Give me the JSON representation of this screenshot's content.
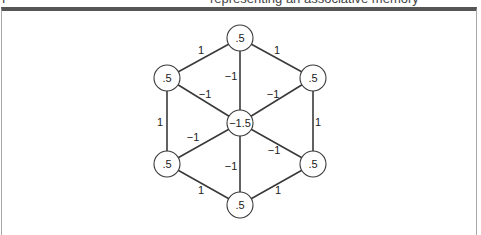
{
  "caption": {
    "prefix": "F",
    "text": "representing an associative memory"
  },
  "diagram": {
    "type": "hopfield-network",
    "nodes": [
      {
        "id": "top",
        "value": ".5"
      },
      {
        "id": "upper-left",
        "value": ".5"
      },
      {
        "id": "upper-right",
        "value": ".5"
      },
      {
        "id": "center",
        "value": "−1.5"
      },
      {
        "id": "lower-left",
        "value": ".5"
      },
      {
        "id": "lower-right",
        "value": ".5"
      },
      {
        "id": "bottom",
        "value": ".5"
      }
    ],
    "edges": [
      {
        "from": "top",
        "to": "upper-left",
        "weight": "1"
      },
      {
        "from": "top",
        "to": "upper-right",
        "weight": "1"
      },
      {
        "from": "top",
        "to": "center",
        "weight": "−1"
      },
      {
        "from": "upper-left",
        "to": "center",
        "weight": "−1"
      },
      {
        "from": "upper-right",
        "to": "center",
        "weight": "−1"
      },
      {
        "from": "upper-left",
        "to": "lower-left",
        "weight": "1"
      },
      {
        "from": "upper-right",
        "to": "lower-right",
        "weight": "1"
      },
      {
        "from": "lower-left",
        "to": "center",
        "weight": "−1"
      },
      {
        "from": "lower-right",
        "to": "center",
        "weight": "−1"
      },
      {
        "from": "bottom",
        "to": "center",
        "weight": "−1"
      },
      {
        "from": "lower-left",
        "to": "bottom",
        "weight": "1"
      },
      {
        "from": "lower-right",
        "to": "bottom",
        "weight": "1"
      }
    ]
  }
}
